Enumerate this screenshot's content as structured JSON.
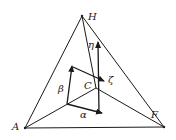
{
  "diagram": {
    "type": "tetrahedron-with-vectors",
    "vertices": {
      "H": {
        "label": "H",
        "x": 82,
        "y": 16
      },
      "A": {
        "label": "A",
        "x": 25,
        "y": 128
      },
      "F": {
        "label": "F",
        "x": 164,
        "y": 127
      },
      "C": {
        "label": "C",
        "x": 96,
        "y": 88
      }
    },
    "vectors": {
      "alpha": {
        "label": "α"
      },
      "beta": {
        "label": "β"
      },
      "zeta": {
        "label": "ζ"
      },
      "eta": {
        "label": "η"
      }
    },
    "colors": {
      "line": "#1a1a1a",
      "background": "#ffffff"
    }
  }
}
